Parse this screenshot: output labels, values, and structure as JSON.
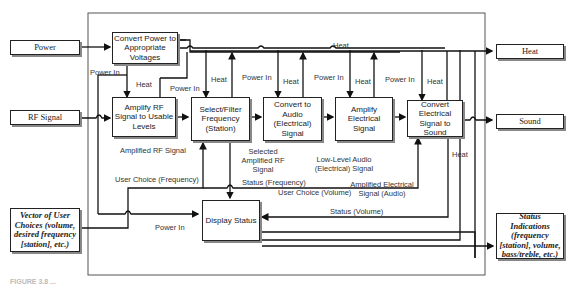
{
  "diagram": {
    "external_inputs": {
      "power": "Power",
      "rf_signal": "RF Signal",
      "user_choices": "Vector of User Choices (volume, desired frequency [station], etc.)"
    },
    "external_outputs": {
      "heat": "Heat",
      "sound": "Sound",
      "status_indications": "Status Indications (frequency [station], volume, bass/treble, etc.)"
    },
    "functions": {
      "convert_power": "Convert Power to Appropriate Voltages",
      "amplify_rf": "Amplify RF Signal to Usable Levels",
      "select_filter": "Select/Filter Frequency (Station)",
      "convert_audio": "Convert to Audio (Electrical) Signal",
      "amplify_electrical": "Amplify Electrical Signal",
      "convert_sound": "Convert Electrical Signal to Sound",
      "display_status": "Display Status"
    },
    "flow_labels": {
      "heat_top": "Heat",
      "power_in_1": "Power In",
      "heat_1": "Heat",
      "power_in_2": "Power In",
      "heat_2": "Heat",
      "power_in_3": "Power In",
      "heat_3": "Heat",
      "power_in_4": "Power In",
      "heat_4": "Heat",
      "power_in_5": "Power In",
      "heat_5": "Heat",
      "heat_display": "Heat",
      "amplified_rf": "Amplified RF Signal",
      "selected_amplified_rf": "Selected Amplified RF Signal",
      "low_level_audio": "Low-Level Audio (Electrical) Signal",
      "amplified_electrical": "Amplified Electrical Signal (Audio)",
      "user_choice_frequency": "User Choice (Frequency)",
      "status_frequency": "Status (Frequency)",
      "user_choice_volume": "User Choice (Volume)",
      "status_volume": "Status (Volume)",
      "power_in_display": "Power In"
    },
    "caption": "FIGURE 3.8 ..."
  }
}
